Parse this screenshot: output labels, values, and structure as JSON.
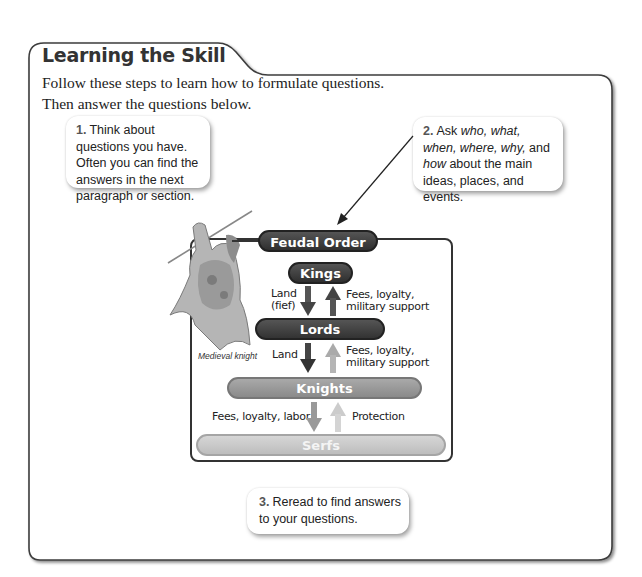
{
  "section": {
    "title": "Learning the Skill",
    "intro_line1": "Follow these steps to learn how to formulate questions.",
    "intro_line2": "Then answer the questions below."
  },
  "steps": [
    {
      "number": "1.",
      "text": "Think about questions you have. Often you can find the answers in the next paragraph or section."
    },
    {
      "number": "2.",
      "text_parts": {
        "ask": "Ask ",
        "who": "who, what, when,",
        "where": "where, why,",
        "and": " and ",
        "how": "how",
        "rest": "about the main ideas, places, and events."
      }
    },
    {
      "number": "3.",
      "text": "Reread to find answers to your questions."
    }
  ],
  "diagram": {
    "title": "Feudal Order",
    "levels": [
      "Kings",
      "Lords",
      "Knights",
      "Serfs"
    ],
    "flows": [
      {
        "down": "Land (fief)",
        "down_line1": "Land",
        "down_line2": "(fief)",
        "up_line1": "Fees, loyalty,",
        "up_line2": "military support"
      },
      {
        "down": "Land",
        "up_line1": "Fees, loyalty,",
        "up_line2": "military support"
      },
      {
        "up": "Protection",
        "down": "Fees, loyalty, labor"
      }
    ],
    "image_caption": "Medieval knight",
    "colors": {
      "dark_pill": "#3a3a3a",
      "knights_pill": "#9a9a9a",
      "serfs_pill": "#c8c8c8"
    }
  }
}
